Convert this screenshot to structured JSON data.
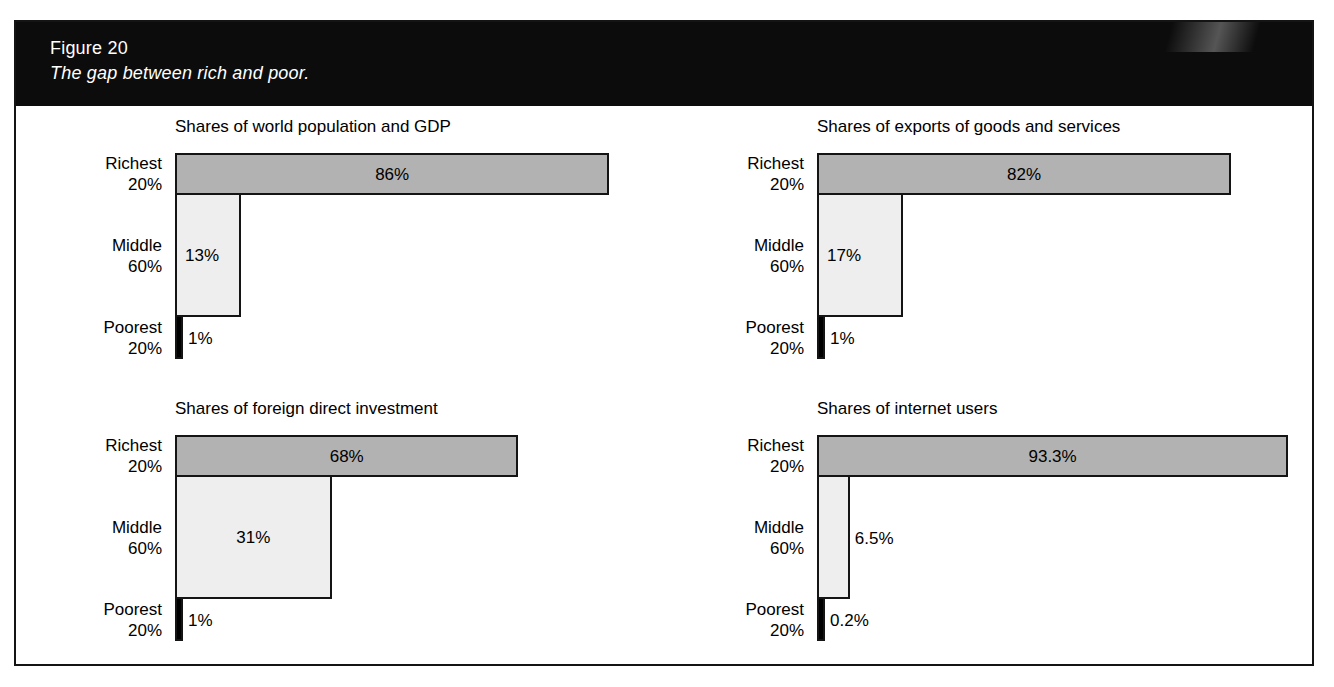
{
  "figure": {
    "number": "Figure 20",
    "subtitle": "The gap between rich and poor.",
    "header_bg": "#0c0c0c",
    "header_text_color": "#ffffff",
    "frame_color": "#141414"
  },
  "palette": {
    "richest_bar": "#b2b2b2",
    "middle_bar": "#eeeeee",
    "poorest_bar": "#000000",
    "bar_outline": "#141414",
    "page_bg": "#ffffff"
  },
  "chart_data": [
    {
      "type": "bar",
      "orientation": "horizontal",
      "title": "Shares of world population and GDP",
      "xlabel": "",
      "ylabel": "",
      "xlim": [
        0,
        100
      ],
      "grid": false,
      "legend": "none",
      "categories": [
        "Richest 20%",
        "Middle 60%",
        "Poorest 20%"
      ],
      "values": [
        86,
        13,
        1
      ],
      "value_labels": [
        "86%",
        "13%",
        "1%"
      ],
      "category_lines": [
        [
          "Richest",
          "20%"
        ],
        [
          "Middle",
          "60%"
        ],
        [
          "Poorest",
          "20%"
        ]
      ],
      "bar_colors": [
        "#b2b2b2",
        "#eeeeee",
        "#000000"
      ],
      "label_placement": [
        "center",
        "inside-left",
        "outside"
      ]
    },
    {
      "type": "bar",
      "orientation": "horizontal",
      "title": "Shares of exports of goods and services",
      "xlabel": "",
      "ylabel": "",
      "xlim": [
        0,
        100
      ],
      "grid": false,
      "legend": "none",
      "categories": [
        "Richest 20%",
        "Middle 60%",
        "Poorest 20%"
      ],
      "values": [
        82,
        17,
        1
      ],
      "value_labels": [
        "82%",
        "17%",
        "1%"
      ],
      "category_lines": [
        [
          "Richest",
          "20%"
        ],
        [
          "Middle",
          "60%"
        ],
        [
          "Poorest",
          "20%"
        ]
      ],
      "bar_colors": [
        "#b2b2b2",
        "#eeeeee",
        "#000000"
      ],
      "label_placement": [
        "center",
        "inside-left",
        "outside"
      ]
    },
    {
      "type": "bar",
      "orientation": "horizontal",
      "title": "Shares of foreign direct investment",
      "xlabel": "",
      "ylabel": "",
      "xlim": [
        0,
        100
      ],
      "grid": false,
      "legend": "none",
      "categories": [
        "Richest 20%",
        "Middle 60%",
        "Poorest 20%"
      ],
      "values": [
        68,
        31,
        1
      ],
      "value_labels": [
        "68%",
        "31%",
        "1%"
      ],
      "category_lines": [
        [
          "Richest",
          "20%"
        ],
        [
          "Middle",
          "60%"
        ],
        [
          "Poorest",
          "20%"
        ]
      ],
      "bar_colors": [
        "#b2b2b2",
        "#eeeeee",
        "#000000"
      ],
      "label_placement": [
        "center",
        "center",
        "outside"
      ]
    },
    {
      "type": "bar",
      "orientation": "horizontal",
      "title": "Shares of internet users",
      "xlabel": "",
      "ylabel": "",
      "xlim": [
        0,
        100
      ],
      "grid": false,
      "legend": "none",
      "categories": [
        "Richest 20%",
        "Middle 60%",
        "Poorest 20%"
      ],
      "values": [
        93.3,
        6.5,
        0.2
      ],
      "value_labels": [
        "93.3%",
        "6.5%",
        "0.2%"
      ],
      "category_lines": [
        [
          "Richest",
          "20%"
        ],
        [
          "Middle",
          "60%"
        ],
        [
          "Poorest",
          "20%"
        ]
      ],
      "bar_colors": [
        "#b2b2b2",
        "#eeeeee",
        "#000000"
      ],
      "label_placement": [
        "center",
        "outside",
        "outside"
      ]
    }
  ]
}
